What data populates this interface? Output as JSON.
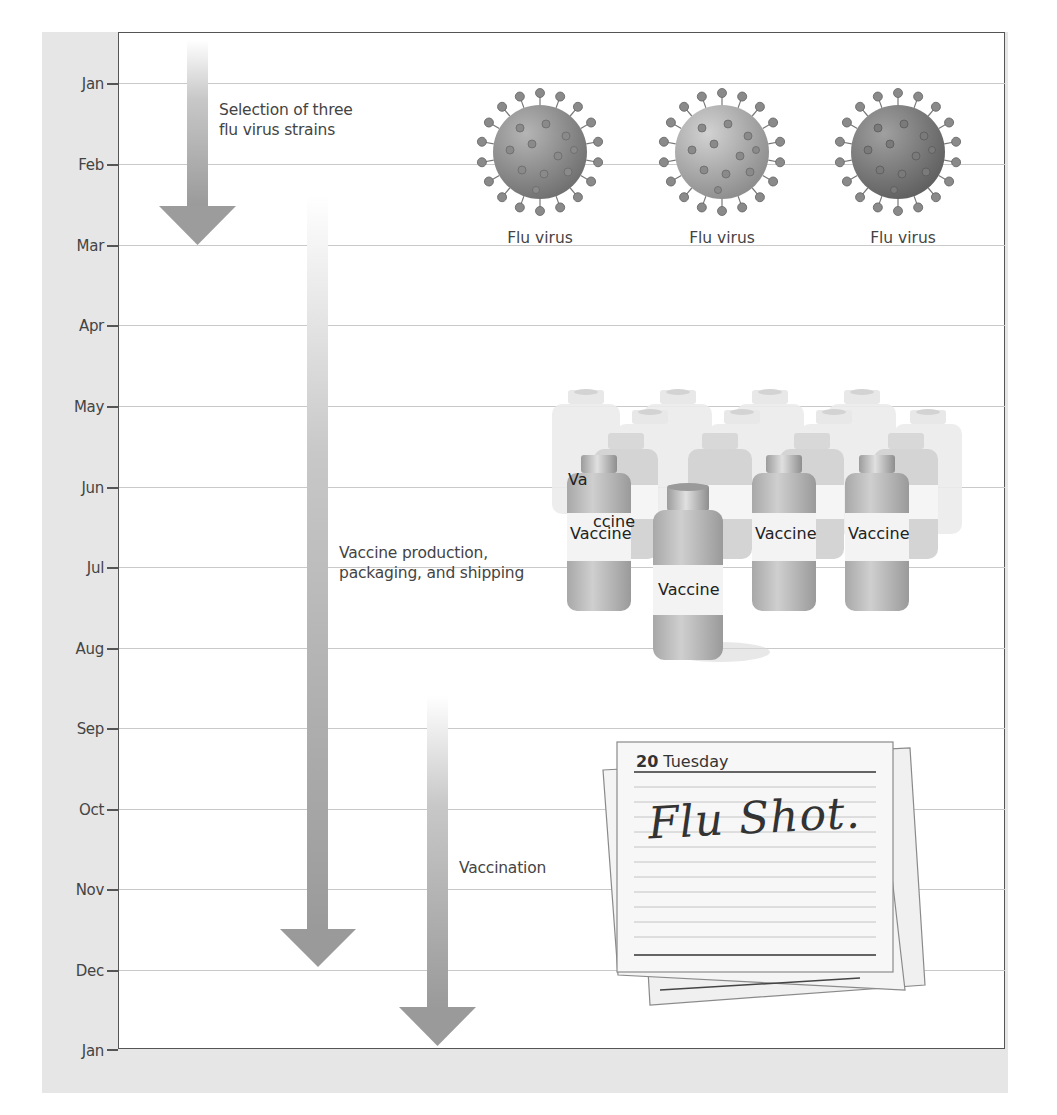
{
  "diagram": {
    "type": "timeline",
    "axis": {
      "months": [
        "Jan",
        "Feb",
        "Mar",
        "Apr",
        "May",
        "Jun",
        "Jul",
        "Aug",
        "Sep",
        "Oct",
        "Nov",
        "Dec",
        "Jan"
      ]
    },
    "stages": [
      {
        "label_line1": "Selection of three",
        "label_line2": "flu virus strains",
        "start_month": "Jan",
        "end_month": "Mar"
      },
      {
        "label_line1": "Vaccine production,",
        "label_line2": "packaging, and shipping",
        "start_month": "Feb",
        "end_month": "Dec"
      },
      {
        "label_line1": "Vaccination",
        "label_line2": "",
        "start_month": "Sep",
        "end_month": "Jan"
      }
    ],
    "viruses": [
      {
        "label": "Flu virus",
        "color": "#8a8a8a"
      },
      {
        "label": "Flu virus",
        "color": "#a8a8a8"
      },
      {
        "label": "Flu virus",
        "color": "#7a7a7a"
      }
    ],
    "vials": {
      "label": "Vaccine",
      "partial_labels": [
        "Va",
        "ccine",
        "ci",
        "ccine",
        "ci",
        "ccine",
        "ci",
        "cine"
      ]
    },
    "calendar": {
      "day_number": "20",
      "day_name": "Tuesday",
      "note": "Flu Shot."
    },
    "colors": {
      "panel": "#e6e6e6",
      "arrow": "#9a9a9a",
      "gridline": "#c9c9c9",
      "axis": "#555555"
    }
  }
}
